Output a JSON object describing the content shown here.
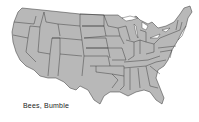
{
  "map": {
    "title": "Bees, Bumble",
    "region": "Contiguous United States",
    "fill_color": "#b8b8b8",
    "border_color": "#333333",
    "highlighted_states": []
  }
}
